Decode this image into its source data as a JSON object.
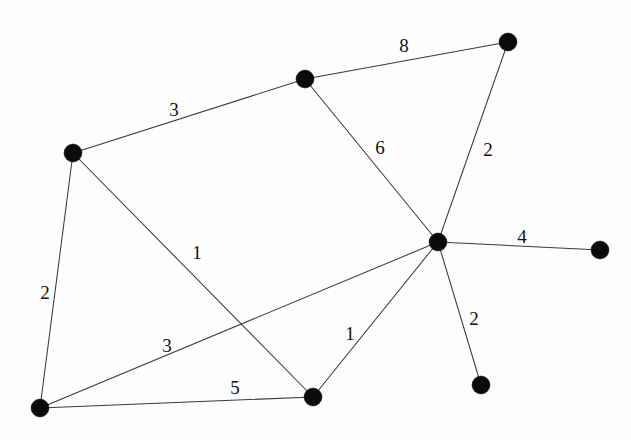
{
  "diagram": {
    "background_color": "#fdfdfd",
    "node_color": "#0b0b0b",
    "edge_color": "#3a3a3a",
    "label_color": "#111111",
    "node_radius": 9,
    "width": 631,
    "height": 440
  },
  "chart_data": {
    "type": "diagram",
    "title": "",
    "nodes": [
      {
        "id": "n1",
        "name": "top-left-node",
        "x": 73,
        "y": 153
      },
      {
        "id": "n2",
        "name": "top-middle-node",
        "x": 305,
        "y": 79
      },
      {
        "id": "n3",
        "name": "top-right-node",
        "x": 508,
        "y": 42
      },
      {
        "id": "n4",
        "name": "hub-node",
        "x": 438,
        "y": 242
      },
      {
        "id": "n5",
        "name": "far-right-node",
        "x": 600,
        "y": 250
      },
      {
        "id": "n6",
        "name": "bottom-left-node",
        "x": 40,
        "y": 408
      },
      {
        "id": "n7",
        "name": "bottom-middle-node",
        "x": 313,
        "y": 397
      },
      {
        "id": "n8",
        "name": "bottom-right-node",
        "x": 481,
        "y": 385
      }
    ],
    "edges": [
      {
        "from": "n1",
        "to": "n2",
        "weight": "3",
        "label_x": 174,
        "label_y": 109
      },
      {
        "from": "n2",
        "to": "n3",
        "weight": "8",
        "label_x": 404,
        "label_y": 45
      },
      {
        "from": "n2",
        "to": "n4",
        "weight": "6",
        "label_x": 380,
        "label_y": 147
      },
      {
        "from": "n3",
        "to": "n4",
        "weight": "2",
        "label_x": 488,
        "label_y": 149
      },
      {
        "from": "n4",
        "to": "n5",
        "weight": "4",
        "label_x": 522,
        "label_y": 236
      },
      {
        "from": "n4",
        "to": "n6",
        "weight": "3",
        "label_x": 167,
        "label_y": 345
      },
      {
        "from": "n4",
        "to": "n7",
        "weight": "1",
        "label_x": 350,
        "label_y": 333
      },
      {
        "from": "n4",
        "to": "n8",
        "weight": "2",
        "label_x": 474,
        "label_y": 318
      },
      {
        "from": "n1",
        "to": "n6",
        "weight": "2",
        "label_x": 45,
        "label_y": 292
      },
      {
        "from": "n1",
        "to": "n7",
        "weight": "1",
        "label_x": 197,
        "label_y": 252
      },
      {
        "from": "n6",
        "to": "n7",
        "weight": "5",
        "label_x": 235,
        "label_y": 387
      }
    ]
  }
}
